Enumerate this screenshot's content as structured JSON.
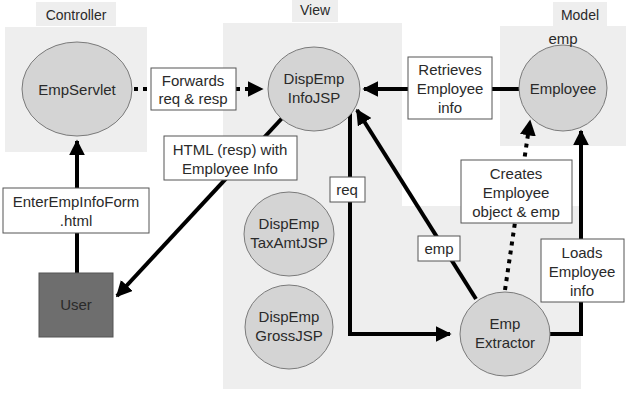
{
  "panels": {
    "controller": {
      "label": "Controller"
    },
    "view": {
      "label": "View"
    },
    "model": {
      "label": "Model"
    }
  },
  "nodes": {
    "emp_servlet": {
      "label": "EmpServlet"
    },
    "disp_emp_info_jsp": {
      "line1": "DispEmp",
      "line2": "InfoJSP"
    },
    "disp_emp_taxamt_jsp": {
      "line1": "DispEmp",
      "line2": "TaxAmtJSP"
    },
    "disp_emp_gross_jsp": {
      "line1": "DispEmp",
      "line2": "GrossJSP"
    },
    "employee": {
      "label": "Employee",
      "instance_label": "emp"
    },
    "emp_extractor": {
      "line1": "Emp",
      "line2": "Extractor"
    },
    "user": {
      "label": "User"
    }
  },
  "edge_labels": {
    "forwards": {
      "line1": "Forwards",
      "line2": "req & resp"
    },
    "retrieves": {
      "line1": "Retrieves",
      "line2": "Employee",
      "line3": "info"
    },
    "html_resp": {
      "line1": "HTML (resp) with",
      "line2": "Employee Info"
    },
    "enter_form": {
      "line1": "EnterEmpInfoForm",
      "line2": ".html"
    },
    "req": {
      "label": "req"
    },
    "emp": {
      "label": "emp"
    },
    "creates": {
      "line1": "Creates",
      "line2": "Employee",
      "line3": "object & emp"
    },
    "loads": {
      "line1": "Loads",
      "line2": "Employee",
      "line3": "info"
    }
  },
  "colors": {
    "panel_bg": "#eeeeee",
    "node_fill": "#d4d4d4",
    "user_fill": "#6e6e6e",
    "arrow": "#000000"
  }
}
